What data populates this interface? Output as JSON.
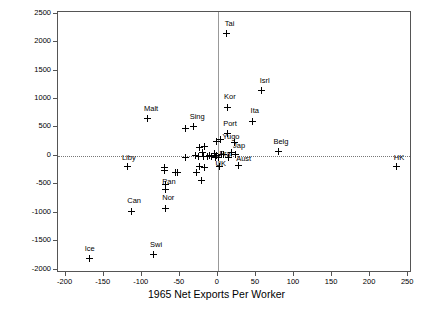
{
  "chart_data": {
    "type": "scatter",
    "title": "",
    "xlabel": "1965 Net Exports Per Worker",
    "ylabel": "1988 Net Exports",
    "xlim": [
      -210,
      255
    ],
    "ylim": [
      -2060,
      2530
    ],
    "xticks": [
      -200,
      -150,
      -100,
      -50,
      0,
      50,
      100,
      150,
      200,
      250
    ],
    "yticks": [
      2500,
      2000,
      1500,
      1000,
      500,
      0,
      -500,
      -1000,
      -1500,
      -2000
    ],
    "grid": false,
    "reference_lines": {
      "horizontal_at_y": 0,
      "vertical_at_x": 0
    },
    "legend": "none",
    "marker": "plus",
    "points": [
      {
        "label": "Tai",
        "x": 11,
        "y": 2150,
        "lx": 9,
        "ly": 2320
      },
      {
        "label": "Isrl",
        "x": 57,
        "y": 1150,
        "lx": 55,
        "ly": 1320
      },
      {
        "label": "Kor",
        "x": 12,
        "y": 855,
        "lx": 8,
        "ly": 1030
      },
      {
        "label": "Malt",
        "x": -92,
        "y": 655,
        "lx": -97,
        "ly": 830
      },
      {
        "label": "Ita",
        "x": 46,
        "y": 610,
        "lx": 43,
        "ly": 785
      },
      {
        "label": "Sing",
        "x": -32,
        "y": 510,
        "lx": -37,
        "ly": 690
      },
      {
        "label": "",
        "x": -43,
        "y": 480,
        "lx": null,
        "ly": null
      },
      {
        "label": "Port",
        "x": 12,
        "y": 385,
        "lx": 7,
        "ly": 560
      },
      {
        "label": "Yugo",
        "x": 4,
        "y": 290,
        "lx": 6,
        "ly": 330
      },
      {
        "label": "",
        "x": -2,
        "y": 250,
        "lx": null,
        "ly": null
      },
      {
        "label": "Jap",
        "x": 22,
        "y": 235,
        "lx": 20,
        "ly": 180
      },
      {
        "label": "Belg",
        "x": 79,
        "y": 80,
        "lx": 73,
        "ly": 245
      },
      {
        "label": "",
        "x": -17,
        "y": 160,
        "lx": null,
        "ly": null
      },
      {
        "label": "",
        "x": -24,
        "y": 150,
        "lx": null,
        "ly": null
      },
      {
        "label": "",
        "x": -20,
        "y": 60,
        "lx": null,
        "ly": null
      },
      {
        "label": "Fra",
        "x": -2,
        "y": 10,
        "lx": 2,
        "ly": 35
      },
      {
        "label": "Aust",
        "x": 23,
        "y": 25,
        "lx": 24,
        "ly": -60
      },
      {
        "label": "",
        "x": 18,
        "y": 55,
        "lx": null,
        "ly": null
      },
      {
        "label": "",
        "x": -8,
        "y": -5,
        "lx": null,
        "ly": null
      },
      {
        "label": "",
        "x": -11,
        "y": 5,
        "lx": null,
        "ly": null
      },
      {
        "label": "",
        "x": -14,
        "y": -10,
        "lx": null,
        "ly": null
      },
      {
        "label": "",
        "x": -19,
        "y": -10,
        "lx": null,
        "ly": null
      },
      {
        "label": "",
        "x": -25,
        "y": -5,
        "lx": null,
        "ly": null
      },
      {
        "label": "",
        "x": -30,
        "y": 0,
        "lx": null,
        "ly": null
      },
      {
        "label": "",
        "x": -5,
        "y": 40,
        "lx": null,
        "ly": null
      },
      {
        "label": "",
        "x": -3,
        "y": -30,
        "lx": null,
        "ly": null
      },
      {
        "label": "",
        "x": 1,
        "y": -20,
        "lx": null,
        "ly": null
      },
      {
        "label": "",
        "x": 5,
        "y": 30,
        "lx": null,
        "ly": null
      },
      {
        "label": "",
        "x": 8,
        "y": 20,
        "lx": null,
        "ly": null
      },
      {
        "label": "",
        "x": 14,
        "y": -20,
        "lx": null,
        "ly": null
      },
      {
        "label": "",
        "x": -43,
        "y": -30,
        "lx": null,
        "ly": null
      },
      {
        "label": "HK",
        "x": 235,
        "y": -180,
        "lx": 231,
        "ly": -30
      },
      {
        "label": "UK",
        "x": 2,
        "y": -185,
        "lx": -3,
        "ly": -145
      },
      {
        "label": "",
        "x": 27,
        "y": -175,
        "lx": null,
        "ly": null
      },
      {
        "label": "Liby",
        "x": -119,
        "y": -190,
        "lx": -126,
        "ly": -35
      },
      {
        "label": "",
        "x": -70,
        "y": -200,
        "lx": null,
        "ly": null
      },
      {
        "label": "",
        "x": -24,
        "y": -190,
        "lx": null,
        "ly": null
      },
      {
        "label": "",
        "x": -18,
        "y": -210,
        "lx": null,
        "ly": null
      },
      {
        "label": "",
        "x": -70,
        "y": -265,
        "lx": null,
        "ly": null
      },
      {
        "label": "",
        "x": -56,
        "y": -290,
        "lx": null,
        "ly": null
      },
      {
        "label": "",
        "x": -53,
        "y": -300,
        "lx": null,
        "ly": null
      },
      {
        "label": "",
        "x": -28,
        "y": -285,
        "lx": null,
        "ly": null
      },
      {
        "label": "",
        "x": -22,
        "y": -425,
        "lx": null,
        "ly": null
      },
      {
        "label": "Pan",
        "x": -69,
        "y": -510,
        "lx": -73,
        "ly": -455
      },
      {
        "label": "",
        "x": -69,
        "y": -590,
        "lx": null,
        "ly": null
      },
      {
        "label": "Nor",
        "x": -69,
        "y": -925,
        "lx": -73,
        "ly": -745
      },
      {
        "label": "Can",
        "x": -113,
        "y": -975,
        "lx": -119,
        "ly": -800
      },
      {
        "label": "Swi",
        "x": -84,
        "y": -1740,
        "lx": -89,
        "ly": -1570
      },
      {
        "label": "Ice",
        "x": -169,
        "y": -1810,
        "lx": -175,
        "ly": -1640
      }
    ]
  },
  "axes": {
    "x_title": "1965 Net Exports Per Worker",
    "y_title": "1988 Net Exports",
    "x_tick_labels": [
      "-200",
      "-150",
      "-100",
      "-50",
      "0",
      "50",
      "100",
      "150",
      "200",
      "250"
    ],
    "y_tick_labels": [
      "2500",
      "2000",
      "1500",
      "1000",
      "500",
      "0",
      "-500",
      "-1000",
      "-1500",
      "-2000"
    ]
  }
}
